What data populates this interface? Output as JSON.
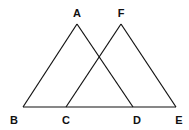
{
  "diagram": {
    "title": "",
    "points": [
      {
        "name": "A",
        "x": 77,
        "y": 24,
        "lx": 77,
        "ly": 17
      },
      {
        "name": "F",
        "x": 121,
        "y": 24,
        "lx": 121,
        "ly": 17
      },
      {
        "name": "B",
        "x": 23,
        "y": 107,
        "lx": 14,
        "ly": 124
      },
      {
        "name": "C",
        "x": 66,
        "y": 107,
        "lx": 66,
        "ly": 124
      },
      {
        "name": "D",
        "x": 133,
        "y": 107,
        "lx": 137,
        "ly": 124
      },
      {
        "name": "E",
        "x": 176,
        "y": 107,
        "lx": 179,
        "ly": 124
      }
    ],
    "segments": [
      [
        "A",
        "B"
      ],
      [
        "A",
        "D"
      ],
      [
        "F",
        "C"
      ],
      [
        "F",
        "E"
      ],
      [
        "B",
        "E"
      ]
    ],
    "stroke_color": "#111111"
  }
}
